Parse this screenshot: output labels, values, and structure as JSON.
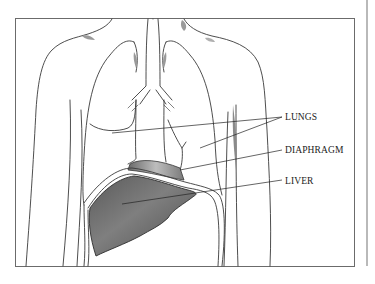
{
  "figure": {
    "labels": [
      {
        "id": "lungs",
        "text": "LUNGS"
      },
      {
        "id": "diaphragm",
        "text": "DIAPHRAGM"
      },
      {
        "id": "liver",
        "text": "LIVER"
      }
    ],
    "colors": {
      "background": "#ffffff",
      "frame": "#6b6b6b",
      "outline": "#3a3a3a",
      "liver_fill": "#6e6e6e",
      "shading": "#9a9a9a"
    }
  }
}
